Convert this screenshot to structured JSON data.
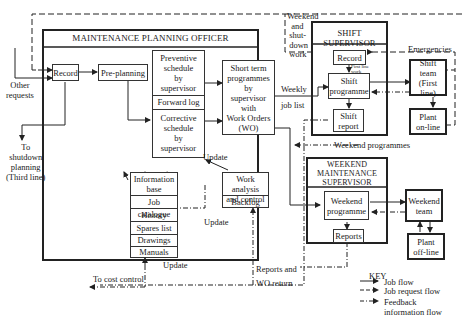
{
  "diagram": {
    "planning_officer": {
      "title": "MAINTENANCE PLANNING OFFICER",
      "record": "Record",
      "preplanning": "Pre-planning",
      "preventive": [
        "Preventive",
        "schedule",
        "by",
        "supervisor"
      ],
      "forward_log": "Forward log",
      "corrective": [
        "Corrective",
        "schedule",
        "by",
        "supervisor"
      ],
      "short_term": [
        "Short term",
        "programmes",
        "by",
        "supervisor",
        "with",
        "Work Orders",
        "(WO)"
      ],
      "info_base": {
        "title": [
          "Information",
          "base"
        ],
        "items": [
          "Job catalogue",
          "History",
          "Spares list",
          "Drawings",
          "Manuals"
        ]
      },
      "work_analysis": [
        "Work analysis",
        "and control"
      ],
      "backlog": "Backlog"
    },
    "shift_supervisor": {
      "title": "SHIFT SUPERVISOR",
      "record": "Record",
      "first_line_work": [
        "First line",
        "work"
      ],
      "programme": [
        "Shift",
        "programme"
      ],
      "report": [
        "Shift",
        "report"
      ]
    },
    "weekend_supervisor": {
      "title": [
        "WEEKEND",
        "MAINTENANCE",
        "SUPERVISOR"
      ],
      "programme": [
        "Weekend",
        "programme"
      ],
      "reports": "Reports"
    },
    "external": {
      "shift_team": [
        "Shift",
        "team",
        "(First line)"
      ],
      "plant_online": [
        "Plant",
        "on-line"
      ],
      "weekend_team": [
        "Weekend",
        "team"
      ],
      "plant_offline": [
        "Plant",
        "off-line"
      ]
    },
    "flow_labels": {
      "other_requests": [
        "Other",
        "requests"
      ],
      "to_shutdown": [
        "To",
        "shutdown",
        "planning",
        "(Third line)"
      ],
      "weekend_shutdown": [
        "Weekend",
        "and",
        "shut-",
        "down",
        "work"
      ],
      "emergencies": "Emergencies",
      "weekly_job_list": [
        "Weekly",
        "job list"
      ],
      "weekend_programmes": "Weekend programmes",
      "update_top": "Update",
      "update_mid": "Update",
      "update_bottom": "Update",
      "reports_wo_return": [
        "Reports and",
        "WO return"
      ],
      "to_cost_control": "To cost control"
    },
    "key": {
      "title": "KEY",
      "items": [
        {
          "style": "solid",
          "label": "Job flow"
        },
        {
          "style": "dashed",
          "label": "Job request flow"
        },
        {
          "style": "dashdot",
          "label": "Feedback information flow"
        }
      ]
    }
  }
}
